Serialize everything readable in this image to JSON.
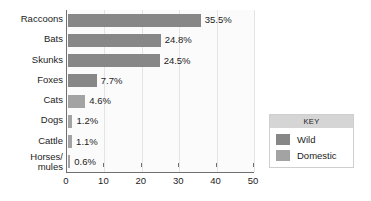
{
  "chart_data": {
    "type": "bar",
    "orientation": "horizontal",
    "title": "",
    "xlabel": "",
    "ylabel": "",
    "xlim": [
      0,
      50
    ],
    "xticks": [
      0,
      10,
      20,
      30,
      40,
      50
    ],
    "xtick_labels": [
      "0",
      "10",
      "20",
      "30",
      "40",
      "50"
    ],
    "grid": true,
    "grid_axis": "x",
    "categories": [
      "Raccoons",
      "Bats",
      "Skunks",
      "Foxes",
      "Cats",
      "Dogs",
      "Cattle",
      "Horses/ mules"
    ],
    "values": [
      35.5,
      24.8,
      24.5,
      7.7,
      4.6,
      1.2,
      1.1,
      0.6
    ],
    "data_labels": [
      "35.5%",
      "24.8%",
      "24.5%",
      "7.7%",
      "4.6%",
      "1.2%",
      "1.1%",
      "0.6%"
    ],
    "groups": [
      "Wild",
      "Wild",
      "Wild",
      "Wild",
      "Domestic",
      "Domestic",
      "Domestic",
      "Domestic"
    ],
    "bars": [
      {
        "category": "Raccoons",
        "label_line1": "Raccoons",
        "label_line2": "",
        "value": 35.5,
        "data_label": "35.5%",
        "group": "Wild"
      },
      {
        "category": "Bats",
        "label_line1": "Bats",
        "label_line2": "",
        "value": 24.8,
        "data_label": "24.8%",
        "group": "Wild"
      },
      {
        "category": "Skunks",
        "label_line1": "Skunks",
        "label_line2": "",
        "value": 24.5,
        "data_label": "24.5%",
        "group": "Wild"
      },
      {
        "category": "Foxes",
        "label_line1": "Foxes",
        "label_line2": "",
        "value": 7.7,
        "data_label": "7.7%",
        "group": "Wild"
      },
      {
        "category": "Cats",
        "label_line1": "Cats",
        "label_line2": "",
        "value": 4.6,
        "data_label": "4.6%",
        "group": "Domestic"
      },
      {
        "category": "Dogs",
        "label_line1": "Dogs",
        "label_line2": "",
        "value": 1.2,
        "data_label": "1.2%",
        "group": "Domestic"
      },
      {
        "category": "Cattle",
        "label_line1": "Cattle",
        "label_line2": "",
        "value": 1.1,
        "data_label": "1.1%",
        "group": "Domestic"
      },
      {
        "category": "Horses/ mules",
        "label_line1": "Horses/",
        "label_line2": "mules",
        "value": 0.6,
        "data_label": "0.6%",
        "group": "Domestic"
      }
    ],
    "legend": {
      "position": "right",
      "title": "KEY",
      "entries": [
        {
          "label": "Wild",
          "color": "#878787"
        },
        {
          "label": "Domestic",
          "color": "#a3a3a3"
        }
      ]
    },
    "colors": {
      "wild": "#878787",
      "domestic": "#a3a3a3",
      "axis": "#6f6f6f",
      "gridline": "#e4e4e4",
      "plot_background": "#fbfbfb",
      "legend_header": "#d5d5d5",
      "text": "#1c1c1c"
    }
  }
}
